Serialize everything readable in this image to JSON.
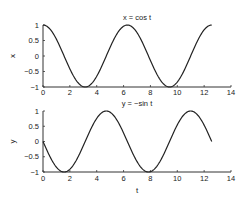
{
  "chart_data": [
    {
      "type": "line",
      "title": "x = cos t",
      "xlabel": "",
      "ylabel": "x",
      "xlim": [
        0,
        14
      ],
      "ylim": [
        -1,
        1
      ],
      "xticks": [
        "0",
        "2",
        "4",
        "6",
        "8",
        "10",
        "12",
        "14"
      ],
      "yticks": [
        "1",
        "0.5",
        "0",
        "−0.5",
        "−1"
      ],
      "grid": false,
      "series": [
        {
          "name": "x = cos t",
          "function": "cos",
          "t_range": [
            0,
            12.566
          ]
        }
      ]
    },
    {
      "type": "line",
      "title": "y = −sin t",
      "xlabel": "t",
      "ylabel": "y",
      "xlim": [
        0,
        14
      ],
      "ylim": [
        -1,
        1
      ],
      "xticks": [
        "0",
        "2",
        "4",
        "6",
        "8",
        "10",
        "12",
        "14"
      ],
      "yticks": [
        "1",
        "0.5",
        "0",
        "−0.5",
        "−1"
      ],
      "grid": false,
      "series": [
        {
          "name": "y = −sin t",
          "function": "-sin",
          "t_range": [
            0,
            12.566
          ]
        }
      ]
    }
  ],
  "colors": {
    "line": "#222222",
    "axis": "#333333"
  }
}
